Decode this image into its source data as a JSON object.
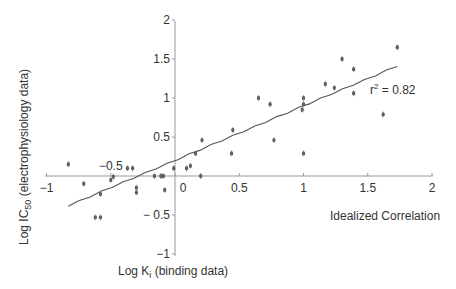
{
  "chart_data": {
    "type": "scatter",
    "title": "",
    "xlabel": "Log K_i (binding data)",
    "ylabel": "Log IC50 (electrophysiology data)",
    "xlim": [
      -1,
      2
    ],
    "ylim": [
      -1,
      2
    ],
    "x_ticks": [
      -1,
      -0.5,
      0,
      0.5,
      1,
      1.5,
      2
    ],
    "x_tick_labels": [
      "−1",
      "−0.5",
      "0",
      "0.5",
      "1",
      "1.5",
      "2"
    ],
    "y_ticks": [
      -1,
      -0.5,
      0.5,
      1,
      1.5,
      2
    ],
    "y_tick_labels": [
      "−1",
      "− 0.5",
      "0.5",
      "1",
      "1.5",
      "2"
    ],
    "grid": false,
    "legend": null,
    "annotations": [
      {
        "text": "r² = 0.82",
        "x": 1.5,
        "y": 1.1
      },
      {
        "text": "Idealized Correlation",
        "x": 1.55,
        "y": -0.38
      }
    ],
    "series": [
      {
        "name": "data",
        "x": [
          -0.83,
          -0.71,
          -0.58,
          -0.62,
          -0.58,
          -0.5,
          -0.48,
          -0.37,
          -0.33,
          -0.3,
          -0.3,
          -0.16,
          -0.11,
          -0.09,
          -0.08,
          -0.01,
          0.09,
          0.12,
          0.16,
          0.21,
          0.2,
          0.45,
          0.44,
          0.65,
          0.74,
          0.77,
          1.0,
          1.0,
          0.99,
          1.0,
          1.17,
          1.24,
          1.3,
          1.39,
          1.39,
          1.62,
          1.73
        ],
        "y": [
          0.15,
          -0.1,
          -0.23,
          -0.53,
          -0.53,
          -0.05,
          -0.01,
          0.1,
          0.1,
          -0.15,
          -0.21,
          0.0,
          0.0,
          0.0,
          -0.18,
          0.1,
          0.1,
          0.13,
          0.29,
          0.46,
          0.0,
          0.59,
          0.29,
          1.0,
          0.92,
          0.46,
          1.0,
          0.92,
          0.85,
          0.29,
          1.18,
          1.13,
          1.5,
          1.37,
          1.06,
          0.79,
          1.65
        ]
      }
    ],
    "fit_line": {
      "name": "regression",
      "x": [
        -0.83,
        1.73
      ],
      "y": [
        -0.38,
        1.41
      ],
      "r_squared": 0.82
    }
  },
  "labels": {
    "r2_base": "r",
    "r2_sup": "2",
    "r2_value": " = 0.82",
    "idealized": "Idealized Correlation",
    "xlabel_main": "Log K",
    "xlabel_sub": "i",
    "xlabel_rest": " (binding data)",
    "ylabel_main": "Log IC",
    "ylabel_sub": "50",
    "ylabel_rest": " (electrophysiology data)"
  }
}
